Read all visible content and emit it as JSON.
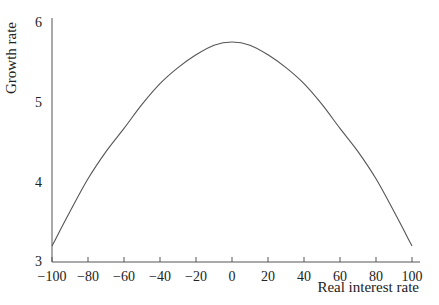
{
  "chart_data": {
    "type": "line",
    "title": "",
    "xlabel": "Real interest rate",
    "ylabel": "Growth rate",
    "xlim": [
      -100,
      100
    ],
    "ylim": [
      3,
      6
    ],
    "x_ticks": [
      -100,
      -80,
      -60,
      -40,
      -20,
      0,
      20,
      40,
      60,
      80,
      100
    ],
    "x_tick_labels": [
      "−100",
      "−80",
      "−60",
      "−40",
      "−20",
      "0",
      "20",
      "40",
      "60",
      "80",
      "100"
    ],
    "y_ticks": [
      3,
      4,
      5,
      6
    ],
    "y_tick_labels": [
      "3",
      "4",
      "5",
      "6"
    ],
    "grid": false,
    "legend": null,
    "series": [
      {
        "name": "Growth rate",
        "x": [
          -100,
          -90,
          -80,
          -70,
          -60,
          -50,
          -40,
          -30,
          -20,
          -10,
          0,
          10,
          20,
          30,
          40,
          50,
          60,
          70,
          80,
          90,
          100
        ],
        "values": [
          3.2,
          3.63,
          4.04,
          4.38,
          4.67,
          4.97,
          5.23,
          5.43,
          5.59,
          5.71,
          5.75,
          5.71,
          5.59,
          5.43,
          5.23,
          4.97,
          4.67,
          4.38,
          4.04,
          3.63,
          3.2
        ]
      }
    ]
  },
  "colors": {
    "line": "#555555",
    "axis": "#555555",
    "text": "#222222"
  }
}
